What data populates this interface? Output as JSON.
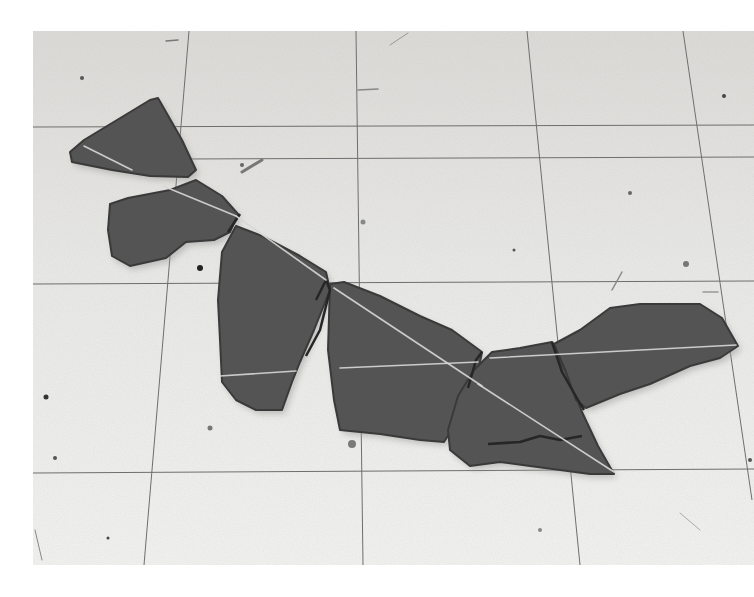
{
  "image": {
    "description": "Black-and-white photograph of broken slate fragments arranged in a line on a tiled floor, with chalk lines drawn across the stones",
    "background_color": "#ffffff",
    "photo_frame": {
      "x": 33,
      "y": 31,
      "width": 721,
      "height": 534
    },
    "floor_color": "#e9e9e7",
    "floor_shade_color": "#dcdcd9",
    "grid_line_color": "#6e6e6e",
    "stone_color": "#545454",
    "stone_dark_color": "#3a3a3a",
    "chalk_color": "#d8d8d8"
  },
  "tile_grid": {
    "horizontal_lines": [
      {
        "x1": 33,
        "y1": 127,
        "x2": 754,
        "y2": 125
      },
      {
        "x1": 180,
        "y1": 159,
        "x2": 754,
        "y2": 157
      },
      {
        "x1": 33,
        "y1": 284,
        "x2": 754,
        "y2": 281
      },
      {
        "x1": 33,
        "y1": 473,
        "x2": 754,
        "y2": 469
      }
    ],
    "vertical_lines": [
      {
        "x1": 189,
        "y1": 31,
        "x2": 144,
        "y2": 565
      },
      {
        "x1": 356,
        "y1": 31,
        "x2": 363,
        "y2": 565
      },
      {
        "x1": 527,
        "y1": 31,
        "x2": 580,
        "y2": 565
      },
      {
        "x1": 683,
        "y1": 31,
        "x2": 752,
        "y2": 500
      }
    ]
  },
  "stones": [
    {
      "name": "stone-top-triangle",
      "points": "70,152 84,140 150,100 158,98 182,140 196,170 188,177 150,176 112,170 72,162"
    },
    {
      "name": "stone-second",
      "points": "110,204 128,198 170,190 196,180 222,196 238,214 230,232 214,240 186,242 166,258 130,266 112,256 108,230"
    },
    {
      "name": "stone-tall",
      "points": "222,252 236,226 262,236 300,256 326,272 330,290 314,330 300,362 292,382 282,410 256,410 236,400 222,382 220,340 218,300"
    },
    {
      "name": "stone-middle",
      "points": "330,284 344,282 380,296 420,316 452,330 482,352 474,392 458,420 444,442 420,440 380,434 340,430 334,400 328,350"
    },
    {
      "name": "stone-lower-right",
      "points": "458,396 474,370 492,352 520,348 552,342 566,372 582,412 598,446 614,474 590,474 560,470 530,466 500,462 470,466 450,450 448,430"
    },
    {
      "name": "stone-right-wing",
      "points": "554,344 580,330 610,308 640,304 700,304 722,318 738,346 720,358 690,366 650,384 620,394 586,408 576,400 566,372"
    }
  ],
  "cracks": [
    {
      "points": "228,232 236,220 240,214"
    },
    {
      "points": "316,300 326,280 330,290 320,330 306,356"
    },
    {
      "points": "468,388 476,360 482,352"
    },
    {
      "points": "552,342 562,372 578,400 584,410"
    },
    {
      "points": "488,444 520,442 540,436 560,440 582,436"
    }
  ],
  "chalk_lines": [
    {
      "x1": 84,
      "y1": 146,
      "x2": 132,
      "y2": 170
    },
    {
      "x1": 163,
      "y1": 186,
      "x2": 236,
      "y2": 216
    },
    {
      "x1": 236,
      "y1": 216,
      "x2": 326,
      "y2": 280
    },
    {
      "x1": 334,
      "y1": 288,
      "x2": 482,
      "y2": 386
    },
    {
      "x1": 478,
      "y1": 384,
      "x2": 614,
      "y2": 472
    },
    {
      "x1": 340,
      "y1": 368,
      "x2": 478,
      "y2": 362
    },
    {
      "x1": 490,
      "y1": 358,
      "x2": 736,
      "y2": 345
    },
    {
      "x1": 220,
      "y1": 376,
      "x2": 296,
      "y2": 371
    }
  ],
  "specks": [
    {
      "cx": 200,
      "cy": 268,
      "r": 3,
      "color": "#222222"
    },
    {
      "cx": 46,
      "cy": 397,
      "r": 2.5,
      "color": "#333333"
    },
    {
      "cx": 352,
      "cy": 444,
      "r": 4,
      "color": "#7a7a7a"
    },
    {
      "cx": 210,
      "cy": 428,
      "r": 2.5,
      "color": "#777777"
    },
    {
      "cx": 55,
      "cy": 458,
      "r": 2,
      "color": "#555555"
    },
    {
      "cx": 242,
      "cy": 165,
      "r": 2,
      "color": "#666666"
    },
    {
      "cx": 630,
      "cy": 193,
      "r": 2,
      "color": "#666666"
    },
    {
      "cx": 686,
      "cy": 264,
      "r": 3,
      "color": "#777777"
    },
    {
      "cx": 363,
      "cy": 222,
      "r": 2.5,
      "color": "#888888"
    },
    {
      "cx": 82,
      "cy": 78,
      "r": 2,
      "color": "#555555"
    },
    {
      "cx": 724,
      "cy": 96,
      "r": 2,
      "color": "#444444"
    },
    {
      "cx": 750,
      "cy": 460,
      "r": 2,
      "color": "#555555"
    },
    {
      "cx": 514,
      "cy": 250,
      "r": 1.5,
      "color": "#555555"
    },
    {
      "cx": 540,
      "cy": 530,
      "r": 2,
      "color": "#888888"
    },
    {
      "cx": 108,
      "cy": 538,
      "r": 1.5,
      "color": "#444444"
    }
  ],
  "scratches": [
    {
      "x1": 242,
      "y1": 172,
      "x2": 262,
      "y2": 160,
      "color": "#777777",
      "w": 3
    },
    {
      "x1": 166,
      "y1": 41,
      "x2": 178,
      "y2": 40,
      "color": "#777777",
      "w": 1.5
    },
    {
      "x1": 358,
      "y1": 90,
      "x2": 378,
      "y2": 89,
      "color": "#888888",
      "w": 1.5
    },
    {
      "x1": 390,
      "y1": 45,
      "x2": 408,
      "y2": 33,
      "color": "#999999",
      "w": 1
    },
    {
      "x1": 612,
      "y1": 290,
      "x2": 622,
      "y2": 272,
      "color": "#888888",
      "w": 1.5
    },
    {
      "x1": 703,
      "y1": 292,
      "x2": 718,
      "y2": 292,
      "color": "#999999",
      "w": 1.5
    },
    {
      "x1": 35,
      "y1": 530,
      "x2": 42,
      "y2": 560,
      "color": "#888888",
      "w": 1
    },
    {
      "x1": 680,
      "y1": 513,
      "x2": 700,
      "y2": 530,
      "color": "#aaaaaa",
      "w": 1
    }
  ]
}
